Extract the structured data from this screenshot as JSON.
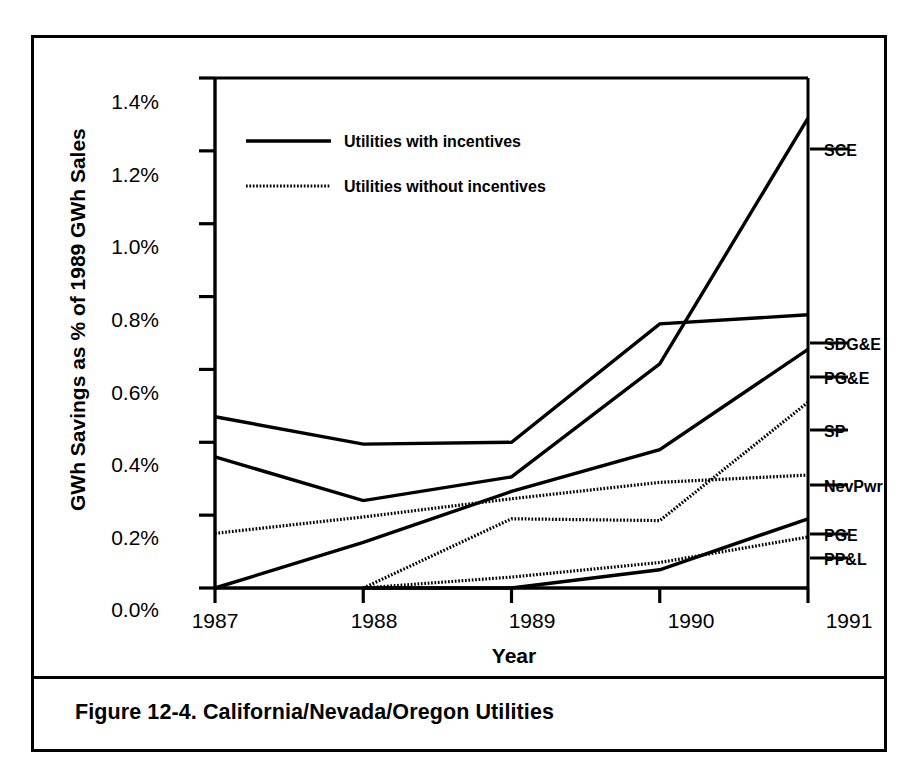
{
  "figure": {
    "caption": "Figure 12-4.  California/Nevada/Oregon Utilities"
  },
  "chart_data": {
    "type": "line",
    "title": "",
    "xlabel": "Year",
    "ylabel": "GWh Savings as % of 1989 GWh Sales",
    "categories": [
      "1987",
      "1988",
      "1989",
      "1990",
      "1991"
    ],
    "x": [
      1987,
      1988,
      1989,
      1990,
      1991
    ],
    "xlim": [
      1987,
      1991
    ],
    "ylim": [
      0.0,
      1.4
    ],
    "yticks": [
      0.0,
      0.2,
      0.4,
      0.6,
      0.8,
      1.0,
      1.2,
      1.4
    ],
    "ytick_labels": [
      "0.0%",
      "0.2%",
      "0.4%",
      "0.6%",
      "0.8%",
      "1.0%",
      "1.2%",
      "1.4%"
    ],
    "xtick_labels": [
      "1987",
      "1988",
      "1989",
      "1990",
      "1991"
    ],
    "grid": false,
    "units": "percent",
    "legend": {
      "position": "top-left-inside",
      "entries": [
        {
          "label": "Utilities with incentives",
          "style": "solid"
        },
        {
          "label": "Utilities without incentives",
          "style": "dotted"
        }
      ]
    },
    "series": [
      {
        "name": "SCE",
        "style": "solid",
        "group": "Utilities with incentives",
        "values": [
          0.36,
          0.24,
          0.305,
          0.615,
          1.29
        ]
      },
      {
        "name": "SDG&E",
        "style": "solid",
        "group": "Utilities with incentives",
        "values": [
          0.47,
          0.395,
          0.4,
          0.725,
          0.75
        ]
      },
      {
        "name": "PG&E",
        "style": "solid",
        "group": "Utilities with incentives",
        "values": [
          0.0,
          0.125,
          0.265,
          0.38,
          0.655
        ]
      },
      {
        "name": "SP",
        "style": "dotted",
        "group": "Utilities without incentives",
        "values": [
          null,
          0.0,
          0.19,
          0.185,
          0.51
        ]
      },
      {
        "name": "NevPwr",
        "style": "dotted",
        "group": "Utilities without incentives",
        "values": [
          0.15,
          0.195,
          0.245,
          0.29,
          0.31
        ]
      },
      {
        "name": "PGE",
        "style": "solid",
        "group": "Utilities with incentives",
        "values": [
          null,
          0.0,
          0.0,
          0.05,
          0.19
        ]
      },
      {
        "name": "PP&L",
        "style": "dotted",
        "group": "Utilities without incentives",
        "values": [
          null,
          0.0,
          0.03,
          0.07,
          0.14
        ]
      }
    ],
    "series_end_labels": [
      "SCE",
      "SDG&E",
      "PG&E",
      "SP",
      "NevPwr",
      "PGE",
      "PP&L"
    ]
  },
  "colors": {
    "ink": "#000000",
    "paper": "#ffffff",
    "dotted_ink": "#555555"
  }
}
